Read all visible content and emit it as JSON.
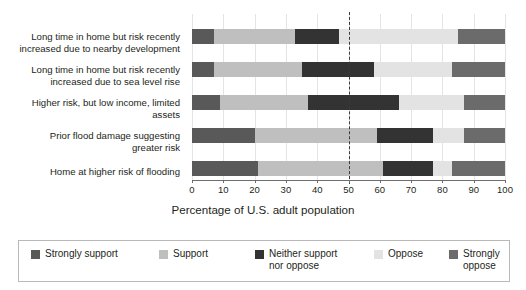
{
  "chart_data": {
    "type": "bar",
    "subtype": "horizontal-stacked-100",
    "title": "",
    "xlabel": "Percentage of U.S. adult population",
    "ylabel": "",
    "xlim": [
      0,
      100
    ],
    "xticks": [
      0,
      10,
      20,
      30,
      40,
      50,
      60,
      70,
      80,
      90,
      100
    ],
    "grid": true,
    "legend_position": "bottom",
    "reference_line": {
      "value": 50,
      "style": "dashed",
      "color": "#3a3a3a"
    },
    "categories": [
      "Long time in home but risk recently increased due to nearby development",
      "Long time in home but risk recently increased due to sea level rise",
      "Higher risk, but low income, limited assets",
      "Prior flood damage suggesting greater risk",
      "Home at higher risk of flooding"
    ],
    "series": [
      {
        "name": "Strongly support",
        "color": "#595959",
        "values": [
          7,
          7,
          9,
          20,
          21
        ]
      },
      {
        "name": "Support",
        "color": "#bfbfbf",
        "values": [
          26,
          28,
          28,
          39,
          40
        ]
      },
      {
        "name": "Neither support nor oppose",
        "color": "#333333",
        "values": [
          14,
          23,
          29,
          18,
          16
        ]
      },
      {
        "name": "Oppose",
        "color": "#e3e3e3",
        "values": [
          38,
          25,
          21,
          10,
          6
        ]
      },
      {
        "name": "Strongly oppose",
        "color": "#6b6b6b",
        "values": [
          15,
          17,
          13,
          13,
          17
        ]
      }
    ]
  },
  "yaxis": {
    "labels": [
      "Long time in home but risk recently\nincreased due to nearby development",
      "Long time in home but risk recently\nincreased due to sea level rise",
      "Higher risk, but low income, limited\nassets",
      "Prior flood damage suggesting\ngreater risk",
      "Home at higher risk of flooding"
    ]
  },
  "xaxis": {
    "title": "Percentage of U.S. adult population",
    "ticklabels": [
      "0",
      "10",
      "20",
      "30",
      "40",
      "50",
      "60",
      "70",
      "80",
      "90",
      "100"
    ]
  },
  "legend": {
    "items": [
      {
        "label": "Strongly support",
        "color": "#595959"
      },
      {
        "label": "Support",
        "color": "#bfbfbf"
      },
      {
        "label": "Neither support\nnor oppose",
        "color": "#333333"
      },
      {
        "label": "Oppose",
        "color": "#e3e3e3"
      },
      {
        "label": "Strongly oppose",
        "color": "#6b6b6b"
      }
    ]
  }
}
